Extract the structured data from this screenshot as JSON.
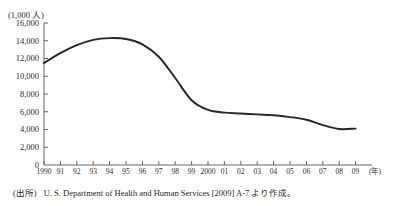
{
  "figure": {
    "title_strip": "",
    "y_axis_unit": "(1,000 人)",
    "x_axis_unit": "(年)",
    "source_tag": "(出所)",
    "source_text": "U. S. Department of Health and Human Services [2009] A-7 より作成。"
  },
  "chart_data": {
    "type": "line",
    "title": "",
    "xlabel": "(年)",
    "ylabel": "(1,000 人)",
    "ylim": [
      0,
      16000
    ],
    "ytick_values": [
      0,
      2000,
      4000,
      6000,
      8000,
      10000,
      12000,
      14000,
      16000
    ],
    "ytick_labels": [
      "0",
      "2,000",
      "4,000",
      "6,000",
      "8,000",
      "10,000",
      "12,000",
      "14,000",
      "16,000"
    ],
    "xtick_labels": [
      "1990",
      "91",
      "92",
      "93",
      "94",
      "95",
      "96",
      "97",
      "98",
      "99",
      "2000",
      "01",
      "02",
      "03",
      "04",
      "05",
      "06",
      "07",
      "08",
      "09"
    ],
    "x": [
      1990,
      1991,
      1992,
      1993,
      1994,
      1995,
      1996,
      1997,
      1998,
      1999,
      2000,
      2001,
      2002,
      2003,
      2004,
      2005,
      2006,
      2007,
      2008,
      2009
    ],
    "values": [
      11500,
      12600,
      13500,
      14100,
      14300,
      14200,
      13600,
      12200,
      9800,
      7300,
      6200,
      5900,
      5800,
      5700,
      5600,
      5400,
      5100,
      4500,
      4050,
      4100
    ],
    "grid": false,
    "legend": false,
    "line_color": "#262626"
  }
}
